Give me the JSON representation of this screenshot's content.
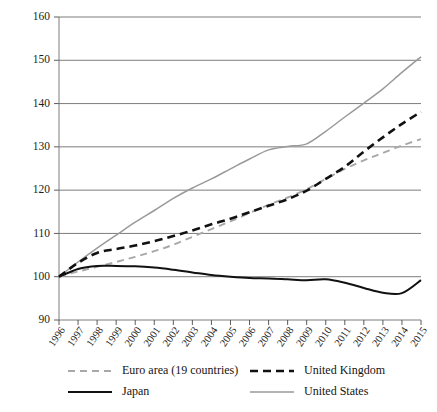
{
  "chart_data": {
    "type": "line",
    "title": "",
    "subtitle": "",
    "xlabel": "",
    "ylabel": "",
    "xlim": [
      1996,
      2015
    ],
    "ylim": [
      90,
      160
    ],
    "yticks": [
      90,
      100,
      110,
      120,
      130,
      140,
      150,
      160
    ],
    "grid": true,
    "legend_position": "bottom",
    "x": [
      1996,
      1997,
      1998,
      1999,
      2000,
      2001,
      2002,
      2003,
      2004,
      2005,
      2006,
      2007,
      2008,
      2009,
      2010,
      2011,
      2012,
      2013,
      2014,
      2015
    ],
    "categories": [
      "1996",
      "1997",
      "1998",
      "1999",
      "2000",
      "2001",
      "2002",
      "2003",
      "2004",
      "2005",
      "2006",
      "2007",
      "2008",
      "2009",
      "2010",
      "2011",
      "2012",
      "2013",
      "2014",
      "2015"
    ],
    "series": [
      {
        "name": "Euro area (19 countries)",
        "color": "#a8a8a8",
        "style": "dashed",
        "width": 1.9,
        "values": [
          100.0,
          101.2,
          102.3,
          103.4,
          104.6,
          105.9,
          107.4,
          109.2,
          111.0,
          112.8,
          114.7,
          116.6,
          118.3,
          120.2,
          122.6,
          124.9,
          126.9,
          128.6,
          130.3,
          131.8
        ]
      },
      {
        "name": "United Kingdom",
        "color": "#111111",
        "style": "dashed",
        "width": 2.6,
        "values": [
          100.0,
          103.2,
          105.5,
          106.4,
          107.2,
          108.2,
          109.4,
          110.7,
          112.1,
          113.4,
          114.9,
          116.4,
          117.9,
          119.9,
          122.6,
          125.4,
          128.9,
          132.2,
          135.3,
          138.1
        ]
      },
      {
        "name": "Japan",
        "color": "#111111",
        "style": "solid",
        "width": 2.0,
        "values": [
          100.0,
          101.8,
          102.5,
          102.5,
          102.4,
          102.1,
          101.6,
          101.0,
          100.4,
          100.0,
          99.7,
          99.6,
          99.4,
          99.2,
          99.4,
          98.6,
          97.4,
          96.3,
          96.2,
          99.2
        ]
      },
      {
        "name": "United States",
        "color": "#9a9a9a",
        "style": "solid",
        "width": 1.5,
        "values": [
          100.0,
          103.4,
          106.6,
          109.6,
          112.6,
          115.3,
          118.1,
          120.5,
          122.6,
          124.9,
          127.2,
          129.3,
          130.1,
          130.7,
          133.6,
          136.9,
          140.1,
          143.4,
          147.2,
          150.8
        ]
      }
    ]
  },
  "legend": {
    "entries": [
      {
        "label": "Euro area (19 countries)",
        "swatch": "dashed-gray"
      },
      {
        "label": "United Kingdom",
        "swatch": "dashed-black"
      },
      {
        "label": "Japan",
        "swatch": "solid-black"
      },
      {
        "label": "United States",
        "swatch": "solid-gray"
      }
    ]
  }
}
